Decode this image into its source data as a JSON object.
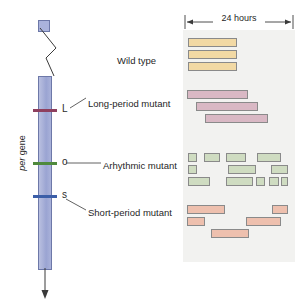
{
  "figure": {
    "gene_label_italic": "per",
    "gene_label_rest": " gene",
    "scale_label": "24 hours"
  },
  "alleles": [
    {
      "letter": "L",
      "color": "#8e3f5e",
      "y": 110
    },
    {
      "letter": "o",
      "color": "#4f8a3c",
      "y": 163
    },
    {
      "letter": "s",
      "color": "#3b5ea8",
      "y": 196
    }
  ],
  "row_labels": [
    {
      "text": "Wild type",
      "x": 117,
      "y": 56
    },
    {
      "text": "Long-period mutant",
      "x": 88,
      "y": 99
    },
    {
      "text": "Arhythmic mutant",
      "x": 103,
      "y": 161
    },
    {
      "text": "Short-period mutant",
      "x": 88,
      "y": 208
    }
  ],
  "chart_data": {
    "type": "bar",
    "xlabel": "Time (scale bar = 24 hours)",
    "ylabel": "Successive days",
    "axis_note": "Scale bar spans 24 hours across the panel width",
    "grid": false,
    "legend": "none",
    "panel_px": {
      "left": 183,
      "top": 30,
      "width": 112,
      "height": 232
    },
    "scale_bar_px": {
      "x1": 185,
      "x2": 279,
      "y": 22,
      "hours": 24
    },
    "groups": [
      {
        "name": "Wild type",
        "fill": "#f2d9a4",
        "stroke": "#8a8a8a",
        "rows": [
          {
            "day": 1,
            "bars": [
              {
                "x": 5,
                "w": 49
              }
            ]
          },
          {
            "day": 2,
            "bars": [
              {
                "x": 5,
                "w": 49
              }
            ]
          },
          {
            "day": 3,
            "bars": [
              {
                "x": 5,
                "w": 49
              }
            ]
          }
        ]
      },
      {
        "name": "Long-period mutant",
        "fill": "#d9b8c4",
        "stroke": "#8a8a8a",
        "rows": [
          {
            "day": 1,
            "bars": [
              {
                "x": 4,
                "w": 61
              }
            ]
          },
          {
            "day": 2,
            "bars": [
              {
                "x": 13,
                "w": 62
              }
            ]
          },
          {
            "day": 3,
            "bars": [
              {
                "x": 22,
                "w": 63
              }
            ]
          }
        ]
      },
      {
        "name": "Arhythmic mutant",
        "fill": "#cfdcc1",
        "stroke": "#8a8a8a",
        "rows": [
          {
            "day": 1,
            "bars": [
              {
                "x": 5,
                "w": 9
              },
              {
                "x": 21,
                "w": 16
              },
              {
                "x": 43,
                "w": 20
              },
              {
                "x": 74,
                "w": 24
              }
            ]
          },
          {
            "day": 2,
            "bars": [
              {
                "x": 5,
                "w": 9
              },
              {
                "x": 45,
                "w": 28
              },
              {
                "x": 88,
                "w": 17
              }
            ]
          },
          {
            "day": 3,
            "bars": [
              {
                "x": 5,
                "w": 22
              },
              {
                "x": 43,
                "w": 27
              },
              {
                "x": 73,
                "w": 9
              },
              {
                "x": 86,
                "w": 10
              },
              {
                "x": 98,
                "w": 7
              }
            ]
          }
        ]
      },
      {
        "name": "Short-period mutant",
        "fill": "#eec0ae",
        "stroke": "#8a8a8a",
        "rows": [
          {
            "day": 1,
            "bars": [
              {
                "x": 4,
                "w": 38
              },
              {
                "x": 89,
                "w": 16
              }
            ]
          },
          {
            "day": 2,
            "bars": [
              {
                "x": 4,
                "w": 18
              },
              {
                "x": 63,
                "w": 35
              }
            ]
          },
          {
            "day": 3,
            "bars": [
              {
                "x": 28,
                "w": 38
              }
            ]
          }
        ]
      }
    ],
    "row_geometry_px": {
      "bar_height": 9,
      "rows_y": [
        38,
        50,
        62,
        90,
        102,
        114,
        153,
        165,
        177,
        205,
        217,
        229
      ]
    }
  }
}
